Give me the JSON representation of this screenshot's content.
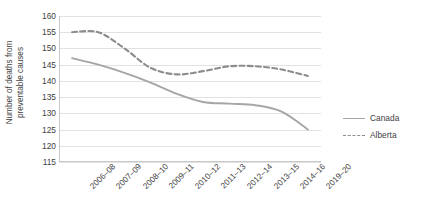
{
  "chart_data": {
    "type": "line",
    "title": "",
    "xlabel": "",
    "ylabel": "Number of deaths from preventable causes",
    "ylabel_lines": [
      "Number of deaths from",
      "preventable causes"
    ],
    "categories": [
      "2006–08",
      "2007–09",
      "2008–10",
      "2009–11",
      "2010–12",
      "2011–13",
      "2012–14",
      "2013–15",
      "2014–16",
      "2019–20"
    ],
    "series": [
      {
        "name": "Canada",
        "style": "solid",
        "color": "#a6a6a6",
        "values": [
          147,
          145,
          142.5,
          139.5,
          136,
          133.5,
          133,
          132.5,
          130.5,
          125
        ]
      },
      {
        "name": "Alberta",
        "style": "dashed",
        "color": "#8c8c8c",
        "values": [
          155,
          155,
          150,
          144,
          142,
          143,
          144.5,
          144.5,
          143.5,
          141.5
        ]
      }
    ],
    "ylim": [
      115,
      160
    ],
    "ytick_values": [
      160,
      155,
      150,
      145,
      140,
      135,
      130,
      125,
      120,
      115
    ],
    "ytick_labels": [
      "160",
      "155",
      "150",
      "145",
      "140",
      "135",
      "130",
      "125",
      "120",
      "115"
    ],
    "grid": true,
    "legend_position": "right"
  },
  "legend": {
    "entries": [
      {
        "label": "Canada",
        "style": "solid"
      },
      {
        "label": "Alberta",
        "style": "dashed"
      }
    ]
  },
  "colors": {
    "canada_line": "#a6a6a6",
    "alberta_line": "#8c8c8c",
    "gridline": "#e2e2e2",
    "axis": "#c9c9c9",
    "text": "#3f3f3f",
    "background": "#ffffff"
  }
}
